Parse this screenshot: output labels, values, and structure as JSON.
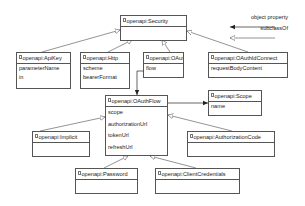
{
  "diagram": {
    "type": "uml-class-diagram",
    "classes": [
      {
        "id": "security",
        "name": "openapi:Security",
        "attributes": []
      },
      {
        "id": "apikey",
        "name": "openapi:ApiKey",
        "attributes": [
          "parameterName",
          "in"
        ]
      },
      {
        "id": "http",
        "name": "openapi:Http",
        "attributes": [
          "scheme",
          "bearerFormat"
        ]
      },
      {
        "id": "oauth2",
        "name": "openapi:OAuth2",
        "attributes": [
          "flow"
        ]
      },
      {
        "id": "oidc",
        "name": "openapi:OAuthIdConnect",
        "attributes": [
          "requestBodyContent"
        ]
      },
      {
        "id": "oauthflow",
        "name": "openapi:OAuthFlow",
        "attributes": [
          "scope",
          "authorizationUrl",
          "tokenUrl",
          "refreshUrl"
        ]
      },
      {
        "id": "scope",
        "name": "openapi:Scope",
        "attributes": [
          "name"
        ]
      },
      {
        "id": "implicit",
        "name": "openapi:Implicit",
        "attributes": []
      },
      {
        "id": "authcode",
        "name": "openapi:AuthorizationCode",
        "attributes": []
      },
      {
        "id": "password",
        "name": "openapi:Password",
        "attributes": []
      },
      {
        "id": "clientcreds",
        "name": "openapi:ClientCredentials",
        "attributes": []
      }
    ],
    "relations": [
      {
        "from": "openapi:ApiKey",
        "to": "openapi:Security",
        "kind": "subclassOf"
      },
      {
        "from": "openapi:Http",
        "to": "openapi:Security",
        "kind": "subclassOf"
      },
      {
        "from": "openapi:OAuth2",
        "to": "openapi:Security",
        "kind": "subclassOf"
      },
      {
        "from": "openapi:OAuthIdConnect",
        "to": "openapi:Security",
        "kind": "subclassOf"
      },
      {
        "from": "openapi:OAuth2",
        "to": "openapi:OAuthFlow",
        "kind": "object property",
        "via": "flow"
      },
      {
        "from": "openapi:OAuthFlow",
        "to": "openapi:Scope",
        "kind": "object property",
        "via": "scope"
      },
      {
        "from": "openapi:Implicit",
        "to": "openapi:OAuthFlow",
        "kind": "subclassOf"
      },
      {
        "from": "openapi:AuthorizationCode",
        "to": "openapi:OAuthFlow",
        "kind": "subclassOf"
      },
      {
        "from": "openapi:Password",
        "to": "openapi:OAuthFlow",
        "kind": "subclassOf"
      },
      {
        "from": "openapi:ClientCredentials",
        "to": "openapi:OAuthFlow",
        "kind": "subclassOf"
      }
    ]
  },
  "legend": {
    "object_property": "object property",
    "subclass_of": "subclassOf"
  },
  "colors": {
    "line": "#555555",
    "background": "#ffffff"
  }
}
